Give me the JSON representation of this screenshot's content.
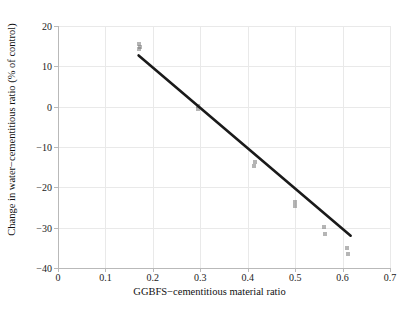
{
  "chart_data": {
    "type": "scatter",
    "title": "",
    "xlabel": "GGBFS−cementitious material ratio",
    "ylabel": "Change in water−cementitious ratio (% of control)",
    "xlim": [
      0,
      0.7
    ],
    "ylim": [
      -40,
      20
    ],
    "xticks": [
      0,
      0.1,
      0.2,
      0.3,
      0.4,
      0.5,
      0.6,
      0.7
    ],
    "xticklabels": [
      "0",
      "0.1",
      "0.2",
      "0.3",
      "0.4",
      "0.5",
      "0.6",
      "0.7"
    ],
    "yticks": [
      -40,
      -30,
      -20,
      -10,
      0,
      10,
      20
    ],
    "yticklabels": [
      "−40",
      "−30",
      "−20",
      "−10",
      "0",
      "10",
      "20"
    ],
    "grid": true,
    "legend": "none",
    "marker": "square",
    "marker_color": "#787878",
    "line_color": "#1a1a1a",
    "grid_color": "#e9e9e9",
    "background_color": "#ffffff",
    "series": [
      {
        "name": "Observations",
        "points": [
          {
            "x": 0.17,
            "y": 15.6
          },
          {
            "x": 0.172,
            "y": 14.9
          },
          {
            "x": 0.171,
            "y": 14.3
          },
          {
            "x": 0.295,
            "y": 0.2
          },
          {
            "x": 0.296,
            "y": -0.6
          },
          {
            "x": 0.415,
            "y": -13.8
          },
          {
            "x": 0.414,
            "y": -14.6
          },
          {
            "x": 0.5,
            "y": -23.7
          },
          {
            "x": 0.499,
            "y": -24.6
          },
          {
            "x": 0.56,
            "y": -29.9
          },
          {
            "x": 0.562,
            "y": -31.5
          },
          {
            "x": 0.61,
            "y": -35.0
          },
          {
            "x": 0.611,
            "y": -36.5
          }
        ]
      }
    ],
    "trendline": {
      "name": "Linear fit",
      "x_start": 0.17,
      "y_start": 12.7,
      "x_end": 0.617,
      "y_end": -32.0
    }
  }
}
